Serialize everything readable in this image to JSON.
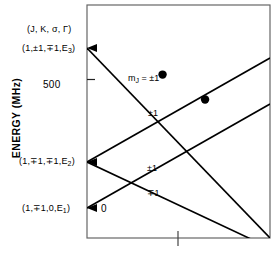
{
  "figure": {
    "type": "energy-level-diagram",
    "axis": {
      "ylabel": "ENERGY (MHz)",
      "yticks": [
        {
          "label": "500",
          "value": 500
        }
      ],
      "xticks": [
        {
          "label": "",
          "value": 1
        }
      ],
      "xlabel": ""
    },
    "header_label": "(J, K, σ, Γ)",
    "states": [
      {
        "id": "E3",
        "label_main": "(1,±1,∓1,E",
        "label_sub": "3",
        "label_tail": ")"
      },
      {
        "id": "E2",
        "label_main": "(1,∓1,∓1,E",
        "label_sub": "2",
        "label_tail": ")"
      },
      {
        "id": "E1",
        "label_main": "(1,∓1,0,E",
        "label_sub": "1",
        "label_tail": ")"
      }
    ],
    "branch_labels": [
      {
        "id": "mj-pm1",
        "text_main": "m",
        "text_sub": "J",
        "text_tail": " = ±1"
      },
      {
        "id": "pm1-upper",
        "text": "±1"
      },
      {
        "id": "pm1-lower",
        "text": "±1"
      },
      {
        "id": "mp1-lower",
        "text": "∓1"
      },
      {
        "id": "zero",
        "text": "0"
      }
    ],
    "colors": {
      "line": "#000000",
      "frame": "#555555",
      "background": "#ffffff"
    }
  },
  "chart_data": {
    "type": "line",
    "title": "",
    "xlabel": "",
    "ylabel": "ENERGY (MHz)",
    "xlim": [
      0,
      1.55
    ],
    "ylim": [
      0,
      720
    ],
    "grid": false,
    "legend": "none",
    "yticks": [
      500
    ],
    "xticks": [
      1
    ],
    "series": [
      {
        "name": "m_J = ±1 (from E3, descending)",
        "origin_state": "E3",
        "x": [
          0,
          1.55
        ],
        "y": [
          648,
          28
        ]
      },
      {
        "name": "±1 (from E2, ascending)",
        "origin_state": "E2",
        "x": [
          0,
          1.55
        ],
        "y": [
          268,
          710
        ]
      },
      {
        "name": "±1 (from E2, descending)",
        "origin_state": "E2",
        "x": [
          0,
          1.55
        ],
        "y": [
          268,
          0
        ]
      },
      {
        "name": "0 → ±1 (from E1, ascending)",
        "origin_state": "E1",
        "x": [
          0,
          1.55
        ],
        "y": [
          118,
          540
        ]
      }
    ],
    "markers": [
      {
        "name": "level-crossing-1",
        "x": 0.64,
        "y": 505
      },
      {
        "name": "level-crossing-2",
        "x": 1.0,
        "y": 428
      }
    ]
  }
}
